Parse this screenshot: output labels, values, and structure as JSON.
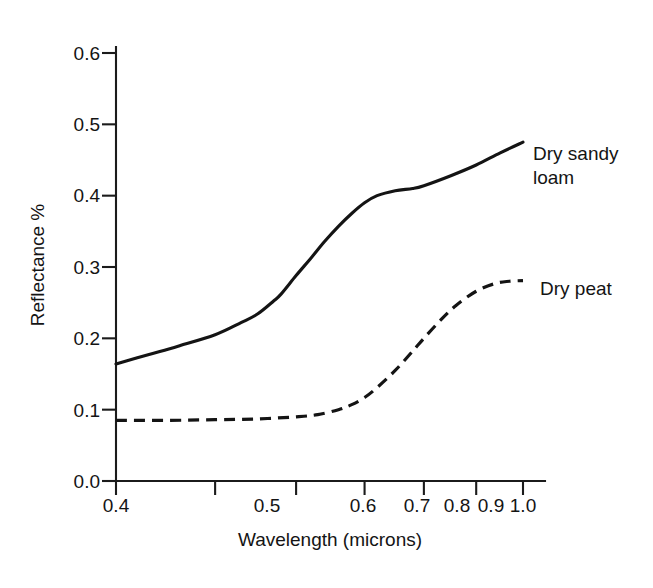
{
  "chart_data": {
    "type": "line",
    "title": "",
    "xlabel": "Wavelength (microns)",
    "ylabel": "Reflectance %",
    "xscale": "log",
    "xlim": [
      0.4,
      1.0
    ],
    "ylim": [
      0.0,
      0.6
    ],
    "grid": false,
    "legend_position": "right-of-plot-inline",
    "xticks": [
      0.4,
      0.5,
      0.6,
      0.7,
      0.8,
      0.9,
      1.0
    ],
    "xticklabels": [
      "0.4",
      "0.5",
      "0.6",
      "0.7",
      "0.8",
      "0.9",
      "1.0"
    ],
    "yticks": [
      0.0,
      0.1,
      0.2,
      0.3,
      0.4,
      0.5,
      0.6
    ],
    "yticklabels": [
      "0.0",
      "0.1",
      "0.2",
      "0.3",
      "0.4",
      "0.5",
      "0.6"
    ],
    "series": [
      {
        "name": "Dry sandy loam",
        "style": "solid",
        "color": "#141414",
        "x": [
          0.4,
          0.43,
          0.46,
          0.5,
          0.53,
          0.55,
          0.57,
          0.58,
          0.6,
          0.62,
          0.64,
          0.66,
          0.68,
          0.7,
          0.72,
          0.75,
          0.78,
          0.8,
          0.85,
          0.9,
          0.95,
          1.0
        ],
        "y": [
          0.164,
          0.177,
          0.189,
          0.205,
          0.222,
          0.234,
          0.252,
          0.262,
          0.288,
          0.312,
          0.336,
          0.357,
          0.375,
          0.39,
          0.4,
          0.407,
          0.41,
          0.414,
          0.428,
          0.443,
          0.46,
          0.475
        ]
      },
      {
        "name": "Dry peat",
        "style": "dashed",
        "color": "#141414",
        "x": [
          0.4,
          0.45,
          0.5,
          0.55,
          0.6,
          0.63,
          0.66,
          0.68,
          0.7,
          0.72,
          0.75,
          0.78,
          0.8,
          0.83,
          0.86,
          0.9,
          0.94,
          0.97,
          1.0
        ],
        "y": [
          0.085,
          0.085,
          0.086,
          0.087,
          0.09,
          0.093,
          0.1,
          0.107,
          0.117,
          0.131,
          0.155,
          0.182,
          0.2,
          0.225,
          0.246,
          0.266,
          0.277,
          0.28,
          0.281
        ]
      }
    ],
    "annotations": [
      {
        "text": "Dry sandy loam",
        "for_series": "Dry sandy loam",
        "line1": "Dry sandy",
        "line2": "loam"
      },
      {
        "text": "Dry peat",
        "for_series": "Dry peat",
        "line1": "Dry peat",
        "line2": ""
      }
    ]
  },
  "labels": {
    "ylabel": "Reflectance %",
    "xlabel": "Wavelength (microns)",
    "series1_line1": "Dry sandy",
    "series1_line2": "loam",
    "series2_line1": "Dry peat",
    "xtick_0": "0.4",
    "xtick_1": "0.5",
    "xtick_2": "0.6",
    "xtick_3": "0.7",
    "xtick_4": "0.8",
    "xtick_5": "0.9",
    "xtick_6": "1.0",
    "ytick_0": "0.0",
    "ytick_1": "0.1",
    "ytick_2": "0.2",
    "ytick_3": "0.3",
    "ytick_4": "0.4",
    "ytick_5": "0.5",
    "ytick_6": "0.6"
  }
}
